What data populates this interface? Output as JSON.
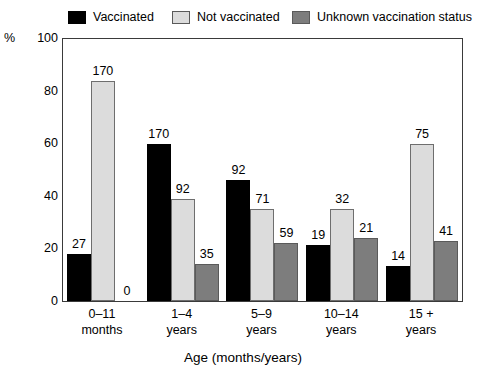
{
  "chart_data": {
    "type": "bar",
    "title": "",
    "xlabel": "Age (months/years)",
    "ylabel": "%",
    "ylim": [
      0,
      100
    ],
    "yticks": [
      0,
      20,
      40,
      60,
      80,
      100
    ],
    "grid": false,
    "legend_position": "top",
    "categories": [
      "0–11 months",
      "1–4 years",
      "5–9 years",
      "10–14 years",
      "15 + years"
    ],
    "category_lines": [
      {
        "line1": "0–11",
        "line2": "months"
      },
      {
        "line1": "1–4",
        "line2": "years"
      },
      {
        "line1": "5–9",
        "line2": "years"
      },
      {
        "line1": "10–14",
        "line2": "years"
      },
      {
        "line1": "15 +",
        "line2": "years"
      }
    ],
    "series": [
      {
        "name": "Vaccinated",
        "color": "#000000",
        "values": [
          18,
          60,
          46,
          21.5,
          13.5
        ],
        "labels": [
          "27",
          "170",
          "92",
          "19",
          "14"
        ]
      },
      {
        "name": "Not vaccinated",
        "color": "#dcdcdc",
        "values": [
          84,
          39,
          35,
          35,
          60
        ],
        "labels": [
          "170",
          "92",
          "71",
          "32",
          "75"
        ]
      },
      {
        "name": "Unknown vaccination status",
        "color": "#7d7d7d",
        "values": [
          0,
          14,
          22,
          24,
          23
        ],
        "labels": [
          "0",
          "35",
          "59",
          "21",
          "41"
        ]
      }
    ]
  },
  "legend": {
    "items": [
      {
        "label": "Vaccinated",
        "color": "#000000"
      },
      {
        "label": "Not vaccinated",
        "color": "#dcdcdc"
      },
      {
        "label": "Unknown vaccination status",
        "color": "#7d7d7d"
      }
    ]
  },
  "axes": {
    "y_unit": "%",
    "y_ticks": [
      "100",
      "80",
      "60",
      "40",
      "20",
      "0"
    ],
    "x_title": "Age (months/years)"
  }
}
